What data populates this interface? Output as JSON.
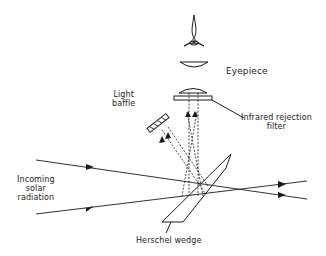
{
  "labels": {
    "eyepiece": "Eyepiece",
    "light_baffle_line1": "Light",
    "light_baffle_line2": "baffle",
    "ir_filter_line1": "Infrared rejection",
    "ir_filter_line2": "filter",
    "incoming_line1": "Incoming",
    "incoming_line2": "solar",
    "incoming_line3": "radiation",
    "herschel_wedge": "Herschel wedge"
  },
  "colors": {
    "ink": "#1a1a1a",
    "background": "#ffffff"
  }
}
